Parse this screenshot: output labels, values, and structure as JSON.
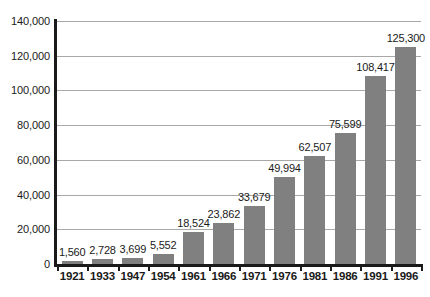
{
  "chart_data": {
    "type": "bar",
    "title": "",
    "subtitle": "",
    "xlabel": "",
    "ylabel": "",
    "categories": [
      "1921",
      "1933",
      "1947",
      "1954",
      "1961",
      "1966",
      "1971",
      "1976",
      "1981",
      "1986",
      "1991",
      "1996"
    ],
    "values": [
      1560,
      2728,
      3699,
      5552,
      18524,
      23862,
      33679,
      49994,
      62507,
      75599,
      108417,
      125300
    ],
    "value_labels": [
      "1,560",
      "2,728",
      "3,699",
      "5,552",
      "18,524",
      "23,862",
      "33,679",
      "49,994",
      "62,507",
      "75,599",
      "108,417",
      "125,300"
    ],
    "ylim": [
      0,
      140000
    ],
    "ytick_values": [
      0,
      20000,
      40000,
      60000,
      80000,
      100000,
      120000,
      140000
    ],
    "ytick_labels": [
      "0",
      "20,000",
      "40,000",
      "60,000",
      "80,000",
      "100,000",
      "120,000",
      "140,000"
    ],
    "grid": true,
    "legend": null,
    "bar_color": "#808080",
    "axis_color": "#1a1a1a",
    "gridline_color": "#a8a8a8",
    "background_color": "#ffffff"
  }
}
